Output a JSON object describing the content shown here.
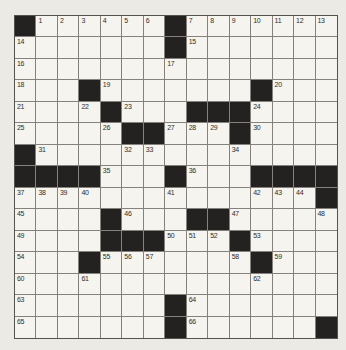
{
  "puzzle": {
    "kind": "crossword",
    "rows": 15,
    "cols": 15,
    "first_number": "1",
    "last_number": "66",
    "grid": [
      [
        "#",
        "1",
        "2",
        "3",
        "4",
        "5",
        "6",
        "#",
        "7",
        "8",
        "9",
        "10",
        "11",
        "12",
        "13"
      ],
      [
        "14",
        "",
        "",
        "",
        "",
        "",
        "",
        "#",
        "15",
        "",
        "",
        "",
        "",
        "",
        ""
      ],
      [
        "16",
        "",
        "",
        "",
        "",
        "",
        "",
        "17",
        "",
        "",
        "",
        "",
        "",
        "",
        ""
      ],
      [
        "18",
        "",
        "",
        "#",
        "19",
        "",
        "",
        "",
        "",
        "",
        "",
        "#",
        "20",
        "",
        ""
      ],
      [
        "21",
        "",
        "",
        "22",
        "#",
        "23",
        "",
        "",
        "#",
        "#",
        "#",
        "24",
        "",
        "",
        ""
      ],
      [
        "25",
        "",
        "",
        "",
        "26",
        "#",
        "#",
        "27",
        "28",
        "29",
        "#",
        "30",
        "",
        "",
        ""
      ],
      [
        "#",
        "31",
        "",
        "",
        "",
        "32",
        "33",
        "",
        "",
        "",
        "34",
        "",
        "",
        "",
        ""
      ],
      [
        "#",
        "#",
        "#",
        "#",
        "35",
        "",
        "",
        "#",
        "36",
        "",
        "",
        "#",
        "#",
        "#",
        "#"
      ],
      [
        "37",
        "38",
        "39",
        "40",
        "",
        "",
        "",
        "41",
        "",
        "",
        "",
        "42",
        "43",
        "44",
        "#"
      ],
      [
        "45",
        "",
        "",
        "",
        "#",
        "46",
        "",
        "",
        "#",
        "#",
        "47",
        "",
        "",
        "",
        "48"
      ],
      [
        "49",
        "",
        "",
        "",
        "#",
        "#",
        "#",
        "50",
        "51",
        "52",
        "#",
        "53",
        "",
        "",
        ""
      ],
      [
        "54",
        "",
        "",
        "#",
        "55",
        "56",
        "57",
        "",
        "",
        "",
        "58",
        "#",
        "59",
        "",
        ""
      ],
      [
        "60",
        "",
        "",
        "61",
        "",
        "",
        "",
        "",
        "",
        "",
        "",
        "62",
        "",
        "",
        ""
      ],
      [
        "63",
        "",
        "",
        "",
        "",
        "",
        "",
        "#",
        "64",
        "",
        "",
        "",
        "",
        "",
        ""
      ],
      [
        "65",
        "",
        "",
        "",
        "",
        "",
        "",
        "#",
        "66",
        "",
        "",
        "",
        "",
        "",
        "#"
      ]
    ],
    "colors": {
      "page_bg": "#eceae5",
      "cell_bg": "#f5f4ef",
      "black_cell": "#232220",
      "grid_line": "#85827d",
      "outer_border": "#55534f",
      "number_color": "#2e2d2b"
    }
  }
}
